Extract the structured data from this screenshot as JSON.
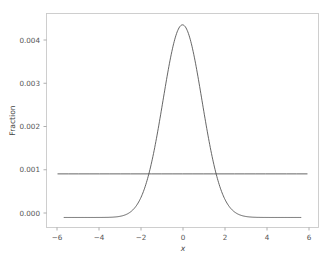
{
  "chart_data": {
    "type": "line",
    "title": "",
    "xlabel": "x",
    "ylabel": "Fraction",
    "xlim": [
      -6.55,
      6.55
    ],
    "ylim": [
      -0.00023,
      0.00468
    ],
    "grid": false,
    "legend": null,
    "xticks": [
      -6,
      -4,
      -2,
      0,
      2,
      4,
      6
    ],
    "xtick_labels": [
      "−6",
      "−4",
      "−2",
      "0",
      "2",
      "4",
      "6"
    ],
    "yticks": [
      0.0,
      0.001,
      0.002,
      0.003,
      0.004
    ],
    "ytick_labels": [
      "0.000",
      "0.001",
      "0.002",
      "0.003",
      "0.004"
    ],
    "series": [
      {
        "name": "gaussian",
        "type": "line",
        "color": "#4a4a4a",
        "peak_x": 0,
        "peak_y": 0.00442,
        "sigma": 0.94,
        "x": [
          -5.7,
          -5.4,
          -5.1,
          -4.8,
          -4.5,
          -4.2,
          -3.9,
          -3.6,
          -3.3,
          -3.0,
          -2.8,
          -2.6,
          -2.4,
          -2.2,
          -2.0,
          -1.8,
          -1.6,
          -1.4,
          -1.2,
          -1.0,
          -0.8,
          -0.6,
          -0.4,
          -0.2,
          0.0,
          0.2,
          0.4,
          0.6,
          0.8,
          1.0,
          1.2,
          1.4,
          1.6,
          1.8,
          2.0,
          2.2,
          2.4,
          2.6,
          2.8,
          3.0,
          3.3,
          3.6,
          3.9,
          4.2,
          4.5,
          4.8,
          5.1,
          5.4,
          5.7
        ],
        "y": [
          0.0,
          0.0,
          0.0,
          1.1e-07,
          3.5e-07,
          1.04e-06,
          2.88e-06,
          7.43e-06,
          1.786e-05,
          3.996e-05,
          7.045e-05,
          0.00011979,
          0.00019652,
          0.00031107,
          0.00047525,
          0.00070026,
          0.00099442,
          0.00136073,
          0.00179474,
          0.00228349,
          0.00280556,
          0.00333211,
          0.00382959,
          0.00426351,
          0.00442,
          0.00426351,
          0.00382959,
          0.00333211,
          0.00280556,
          0.00228349,
          0.00179474,
          0.00136073,
          0.00099442,
          0.00070026,
          0.00047525,
          0.00031107,
          0.00019652,
          0.00011979,
          7.045e-05,
          3.996e-05,
          1.786e-05,
          7.43e-06,
          2.88e-06,
          1.04e-06,
          3.5e-07,
          1.1e-07,
          0.0,
          0.0,
          0.0
        ]
      },
      {
        "name": "uniform-baseline",
        "type": "line",
        "color": "#4a4a4a",
        "constant_value": 0.001,
        "x": [
          -6.0,
          -5.5,
          -5.0,
          -4.5,
          -4.0,
          -3.5,
          -3.0,
          -2.5,
          -2.0,
          -1.5,
          -1.0,
          -0.5,
          0.0,
          0.5,
          1.0,
          1.5,
          2.0,
          2.5,
          3.0,
          3.5,
          4.0,
          4.5,
          5.0,
          5.5,
          6.0
        ],
        "y": [
          0.001,
          0.001,
          0.001,
          0.001,
          0.001,
          0.001,
          0.001,
          0.001,
          0.001,
          0.001,
          0.001,
          0.001,
          0.001,
          0.001,
          0.001,
          0.001,
          0.001,
          0.001,
          0.001,
          0.001,
          0.001,
          0.001,
          0.001,
          0.001,
          0.001
        ]
      }
    ]
  },
  "figure": {
    "background_color": "#ffffff",
    "frame_color": "#c9c9c9",
    "line_color": "#4a4a4a",
    "tick_color": "#555555"
  }
}
